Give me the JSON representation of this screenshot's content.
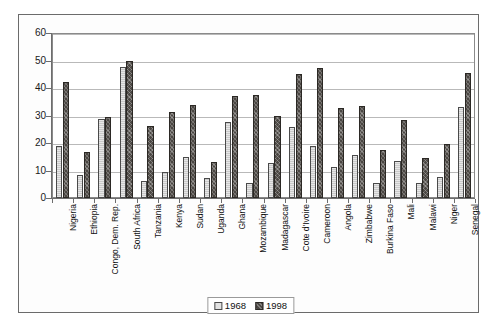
{
  "chart_data": {
    "type": "bar",
    "title": "",
    "subtitle": "",
    "xlabel": "",
    "ylabel": "",
    "ylim": [
      0,
      60
    ],
    "ytick_step": 10,
    "yticks": [
      0,
      10,
      20,
      30,
      40,
      50,
      60
    ],
    "grid": true,
    "legend_position": "bottom-center",
    "categories": [
      "Nigeria",
      "Ethiopia",
      "Congo, Dem. Rep.",
      "South Africa",
      "Tanzania",
      "Kenya",
      "Sudan",
      "Uganda",
      "Ghana",
      "Mozambique",
      "Madagascar",
      "Cote d'Ivoire",
      "Cameroon",
      "Angola",
      "Zimbabwe",
      "Burkina Faso",
      "Mali",
      "Malawi",
      "Niger",
      "Senegal"
    ],
    "series": [
      {
        "name": "1968",
        "color": "#c9c9c9",
        "values": [
          18.8,
          8.2,
          28.6,
          47.5,
          6.2,
          9.6,
          15.0,
          7.4,
          27.8,
          5.4,
          12.8,
          25.8,
          18.8,
          11.2,
          15.6,
          5.4,
          13.4,
          5.6,
          7.6,
          33.0
        ]
      },
      {
        "name": "1998",
        "color": "#4b4743",
        "values": [
          42.2,
          16.6,
          29.6,
          50.0,
          26.2,
          31.2,
          34.0,
          13.2,
          37.2,
          37.4,
          29.8,
          45.0,
          47.2,
          32.8,
          33.4,
          17.4,
          28.2,
          14.6,
          19.8,
          45.6
        ]
      }
    ]
  },
  "legend": {
    "entries": [
      {
        "label": "1968"
      },
      {
        "label": "1998"
      }
    ]
  },
  "colors": {
    "series_1968": "#c9c9c9",
    "series_1998": "#4b4743",
    "gridline": "#b9b9b9",
    "axis": "#6d6d6d",
    "frame": "#6b6b6b",
    "text": "#111111",
    "background": "#ffffff"
  }
}
